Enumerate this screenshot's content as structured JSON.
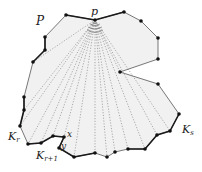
{
  "diagram": {
    "labels": {
      "polygon": "P",
      "apex": "p",
      "chain_r": "K",
      "chain_r_sub": "r",
      "chain_r1": "K",
      "chain_r1_sub": "r+1",
      "chain_s": "K",
      "chain_s_sub": "s",
      "point_x": "x",
      "point_y": "y"
    },
    "colors": {
      "fill": "#f1f1f1",
      "edge": "#555555",
      "bold_edge": "#1a1a1a",
      "vertex": "#111111",
      "ray": "#8a8a8a"
    },
    "vertices": [
      [
        66,
        15
      ],
      [
        95,
        20
      ],
      [
        124,
        12
      ],
      [
        141,
        21
      ],
      [
        158,
        38
      ],
      [
        158,
        59
      ],
      [
        120,
        72
      ],
      [
        158,
        84
      ],
      [
        179,
        114
      ],
      [
        170,
        131
      ],
      [
        157,
        135
      ],
      [
        145,
        149
      ],
      [
        128,
        149
      ],
      [
        115,
        152
      ],
      [
        107,
        157
      ],
      [
        95,
        153
      ],
      [
        74,
        157
      ],
      [
        59,
        148
      ],
      [
        64,
        137
      ],
      [
        53,
        136
      ],
      [
        41,
        143
      ],
      [
        28,
        144
      ],
      [
        20,
        126
      ],
      [
        24,
        110
      ],
      [
        24,
        97
      ],
      [
        33,
        62
      ],
      [
        45,
        50
      ],
      [
        45,
        37
      ]
    ]
  }
}
